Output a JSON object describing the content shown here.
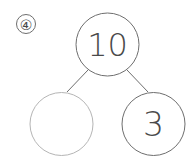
{
  "problem": {
    "label": "④",
    "whole": "10",
    "part_left": "",
    "part_right": "3"
  },
  "colors": {
    "stroke_dark": "#6e6e6e",
    "stroke_light": "#b5b5b5",
    "text": "#4a4a4a"
  }
}
